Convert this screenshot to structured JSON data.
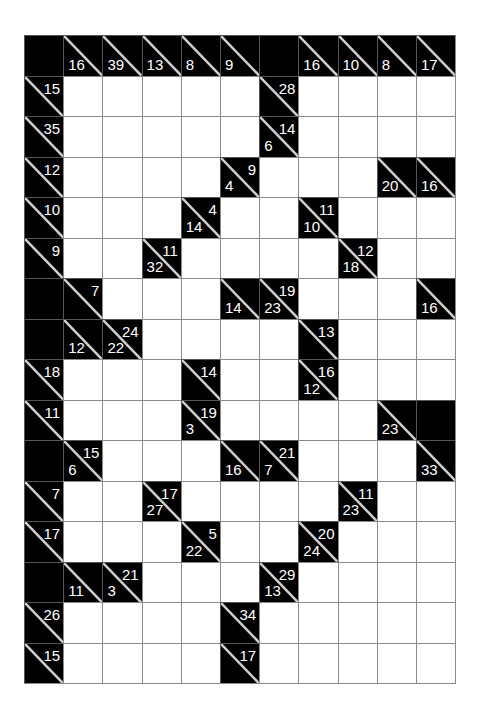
{
  "puzzle": {
    "type": "kakuro",
    "rows": 16,
    "cols": 11,
    "colors": {
      "black": "#000000",
      "white": "#ffffff",
      "grid": "#8a8a8a",
      "clue_text": "#ffffff"
    },
    "grid": [
      [
        "B",
        {
          "d": 16
        },
        {
          "d": 39
        },
        {
          "d": 13
        },
        {
          "d": 8
        },
        {
          "d": 9
        },
        "B",
        {
          "d": 16
        },
        {
          "d": 10
        },
        {
          "d": 8
        },
        {
          "d": 17
        }
      ],
      [
        {
          "r": 15
        },
        "W",
        "W",
        "W",
        "W",
        "W",
        {
          "r": 28
        },
        "W",
        "W",
        "W",
        "W"
      ],
      [
        {
          "r": 35
        },
        "W",
        "W",
        "W",
        "W",
        "W",
        {
          "d": 6,
          "r": 14
        },
        "W",
        "W",
        "W",
        "W"
      ],
      [
        {
          "r": 12
        },
        "W",
        "W",
        "W",
        "W",
        {
          "d": 4,
          "r": 9
        },
        "W",
        "W",
        "W",
        {
          "d": 20
        },
        {
          "d": 16
        }
      ],
      [
        {
          "r": 10
        },
        "W",
        "W",
        "W",
        {
          "d": 14,
          "r": 4
        },
        "W",
        "W",
        {
          "d": 10,
          "r": 11
        },
        "W",
        "W",
        "W"
      ],
      [
        {
          "r": 9
        },
        "W",
        "W",
        {
          "d": 32,
          "r": 11
        },
        "W",
        "W",
        "W",
        "W",
        {
          "d": 18,
          "r": 12
        },
        "W",
        "W"
      ],
      [
        "B",
        {
          "r": 7
        },
        "W",
        "W",
        "W",
        {
          "d": 14
        },
        {
          "d": 23,
          "r": 19
        },
        "W",
        "W",
        "W",
        {
          "d": 16
        }
      ],
      [
        "B",
        {
          "d": 12
        },
        {
          "d": 22,
          "r": 24
        },
        "W",
        "W",
        "W",
        "W",
        {
          "r": 13
        },
        "W",
        "W",
        "W"
      ],
      [
        {
          "r": 18
        },
        "W",
        "W",
        "W",
        {
          "r": 14
        },
        "W",
        "W",
        {
          "d": 12,
          "r": 16
        },
        "W",
        "W",
        "W"
      ],
      [
        {
          "r": 11
        },
        "W",
        "W",
        "W",
        {
          "d": 3,
          "r": 19
        },
        "W",
        "W",
        "W",
        "W",
        {
          "d": 23
        },
        "B"
      ],
      [
        "B",
        {
          "d": 6,
          "r": 15
        },
        "W",
        "W",
        "W",
        {
          "d": 16
        },
        {
          "d": 7,
          "r": 21
        },
        "W",
        "W",
        "W",
        {
          "d": 33
        }
      ],
      [
        {
          "r": 7
        },
        "W",
        "W",
        {
          "d": 27,
          "r": 17
        },
        "W",
        "W",
        "W",
        "W",
        {
          "d": 23,
          "r": 11
        },
        "W",
        "W"
      ],
      [
        {
          "r": 17
        },
        "W",
        "W",
        "W",
        {
          "d": 22,
          "r": 5
        },
        "W",
        "W",
        {
          "d": 24,
          "r": 20
        },
        "W",
        "W",
        "W"
      ],
      [
        "B",
        {
          "d": 11
        },
        {
          "d": 3,
          "r": 21
        },
        "W",
        "W",
        "W",
        {
          "d": 13,
          "r": 29
        },
        "W",
        "W",
        "W",
        "W"
      ],
      [
        {
          "r": 26
        },
        "W",
        "W",
        "W",
        "W",
        {
          "r": 34
        },
        "W",
        "W",
        "W",
        "W",
        "W"
      ],
      [
        {
          "r": 15
        },
        "W",
        "W",
        "W",
        "W",
        {
          "r": 17
        },
        "W",
        "W",
        "W",
        "W",
        "W"
      ]
    ]
  }
}
